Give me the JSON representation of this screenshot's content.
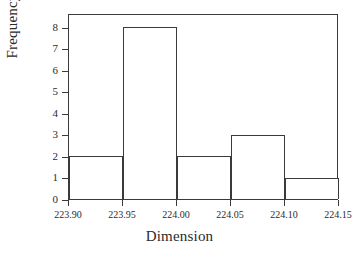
{
  "chart_data": {
    "type": "bar",
    "title": "",
    "xlabel": "Dimension",
    "ylabel": "Frequency",
    "categories": [
      "223.90-223.95",
      "223.95-224.00",
      "224.00-224.05",
      "224.05-224.10",
      "224.10-224.15"
    ],
    "bin_edges": [
      223.9,
      223.95,
      224.0,
      224.05,
      224.1,
      224.15
    ],
    "values": [
      2,
      8,
      2,
      3,
      1
    ],
    "xlim": [
      223.9,
      224.15
    ],
    "ylim": [
      0,
      8.65
    ],
    "xticks": [
      "223.90",
      "223.95",
      "224.00",
      "224.05",
      "224.10",
      "224.15"
    ],
    "xtick_values": [
      223.9,
      223.95,
      224.0,
      224.05,
      224.1,
      224.15
    ],
    "yticks": [
      "0",
      "1",
      "2",
      "3",
      "4",
      "5",
      "6",
      "7",
      "8"
    ],
    "ytick_values": [
      0,
      1,
      2,
      3,
      4,
      5,
      6,
      7,
      8
    ],
    "grid": false,
    "legend": null,
    "bar_fill_color": "#ffffff",
    "bar_edge_color": "#3a3a3a",
    "background_color": "#ffffff",
    "text_color": "#2b2b2b"
  }
}
